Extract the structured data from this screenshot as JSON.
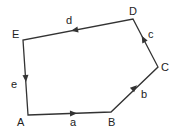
{
  "diagram": {
    "type": "vector polygon",
    "vertices": [
      {
        "id": "A",
        "label": "A",
        "x": 28,
        "y": 115,
        "lx": 17,
        "ly": 117
      },
      {
        "id": "B",
        "label": "B",
        "x": 111,
        "y": 112,
        "lx": 108,
        "ly": 117
      },
      {
        "id": "C",
        "label": "C",
        "x": 158,
        "y": 67,
        "lx": 161,
        "ly": 62
      },
      {
        "id": "D",
        "label": "D",
        "x": 133,
        "y": 19,
        "lx": 129,
        "ly": 6
      },
      {
        "id": "E",
        "label": "E",
        "x": 23,
        "y": 40,
        "lx": 12,
        "ly": 29
      }
    ],
    "edges": [
      {
        "label": "a",
        "from": "A",
        "to": "B",
        "lx": 70,
        "ly": 117
      },
      {
        "label": "b",
        "from": "B",
        "to": "C",
        "lx": 141,
        "ly": 89
      },
      {
        "label": "c",
        "from": "C",
        "to": "D",
        "lx": 148,
        "ly": 29
      },
      {
        "label": "d",
        "from": "D",
        "to": "E",
        "lx": 66,
        "ly": 16
      },
      {
        "label": "e",
        "from": "E",
        "to": "A",
        "lx": 11,
        "ly": 80
      }
    ],
    "stroke_color": "#333333"
  }
}
